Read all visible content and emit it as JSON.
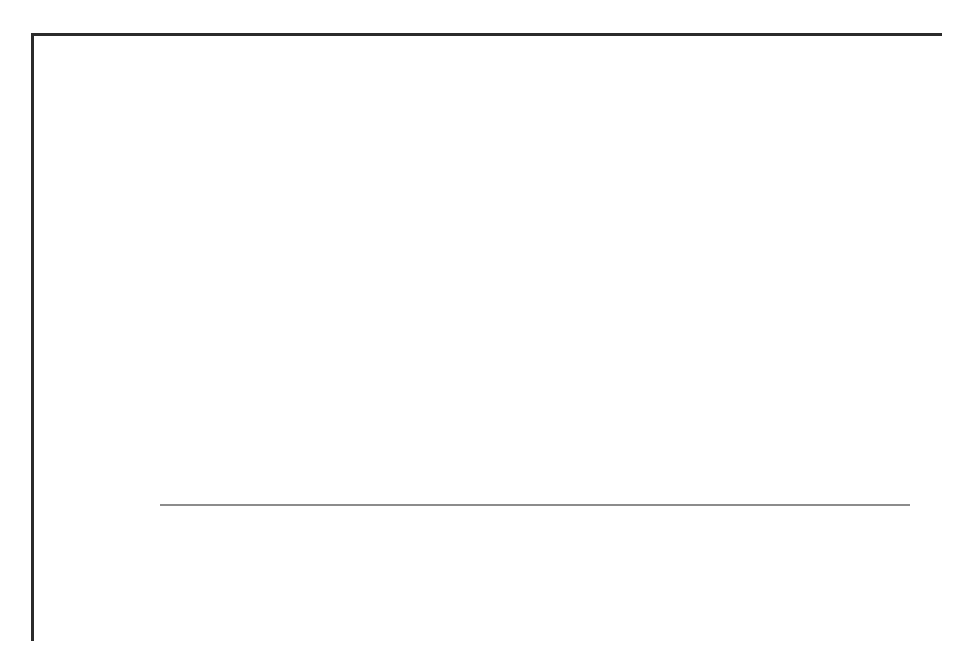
{
  "figure": {
    "frame_color": "#2b2b2b",
    "background": "#ffffff"
  },
  "axis": {
    "y_title": "Mrd. EUR",
    "y_ticks": [
      "0",
      "5",
      "10",
      "15",
      "20",
      "25"
    ]
  },
  "legend": {
    "items": [
      {
        "label": "Personalaufwand",
        "color": "#808080",
        "swatch_name": "legend-swatch-personalaufwand"
      },
      {
        "label": "Sachaufwand",
        "color": "#e4e4e4",
        "swatch_name": "legend-swatch-sachaufwand"
      }
    ]
  },
  "chart_data": {
    "type": "bar",
    "stacked": true,
    "title": "",
    "xlabel": "",
    "ylabel": "Mrd. EUR",
    "ylim": [
      0,
      25
    ],
    "yticks": [
      0,
      5,
      10,
      15,
      20,
      25
    ],
    "grid": true,
    "legend_position": "bottom",
    "decimal_separator": ",",
    "categories": [
      "2005",
      "2006",
      "2007",
      "2008",
      "2009",
      "2010",
      "2011",
      "2012",
      "2013"
    ],
    "series": [
      {
        "name": "Personalaufwand",
        "color": "#808080",
        "values": [
          11.2,
          11.0,
          10.8,
          11.2,
          11.4,
          11.3,
          11.3,
          11.7,
          11.8
        ],
        "labels": [
          "11,2",
          "11,0",
          "10,8",
          "11,2",
          "11,4",
          "11,3",
          "11,3",
          "11,7",
          "11,8"
        ]
      },
      {
        "name": "Sachaufwand",
        "color": "#e4e4e4",
        "values": [
          7.0,
          7.1,
          7.1,
          7.0,
          6.9,
          6.9,
          6.9,
          6.8,
          6.9
        ],
        "labels": [
          "7,0",
          "7,1",
          "7,1",
          "7,0",
          "6,9",
          "6,9",
          "6,9",
          "6,8",
          "6,9"
        ]
      }
    ],
    "totals": [
      18.2,
      18.1,
      17.9,
      18.2,
      18.3,
      18.2,
      18.2,
      18.5,
      18.7
    ]
  }
}
